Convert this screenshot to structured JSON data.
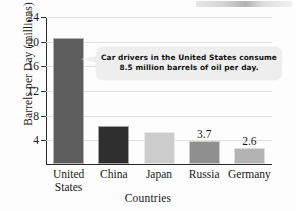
{
  "chart_data": {
    "type": "bar",
    "title": "",
    "xlabel": "Countries",
    "ylabel": "Barrels per Day (millions)",
    "categories": [
      "United States",
      "China",
      "Japan",
      "Russia",
      "Germany"
    ],
    "values": [
      20.5,
      6.1,
      5.2,
      3.7,
      2.6
    ],
    "value_labels": [
      "",
      "",
      "",
      "3.7",
      "2.6"
    ],
    "bar_colors": [
      "#5d5d5d",
      "#2f2f2f",
      "#cccccc",
      "#8f8f8f",
      "#b3b3b3"
    ],
    "ylim": [
      0,
      24
    ],
    "yticks": [
      4,
      8,
      12,
      16,
      20,
      24
    ],
    "ytick_labels": [
      "4",
      "8",
      "12",
      "16",
      "20",
      "24"
    ],
    "grid": true,
    "legend": "none",
    "annotations": [
      {
        "text_line1": "Car drivers in the United States consume",
        "text_line2": "8.5 million barrels of oil per day.",
        "points_at": "United States"
      }
    ]
  },
  "axes": {
    "y_title": "Barrels per Day (millions)",
    "x_title": "Countries"
  },
  "callout": {
    "line1": "Car drivers in the United States consume",
    "line2": "8.5 million barrels of oil per day."
  }
}
